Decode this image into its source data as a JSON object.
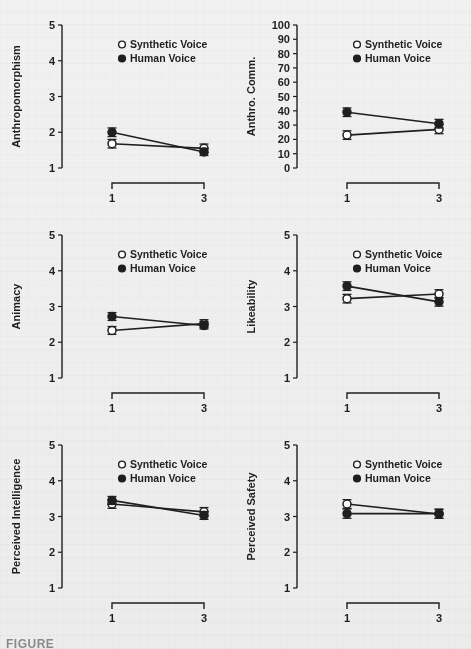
{
  "figure": {
    "caption_prefix": "FIGURE",
    "background_color": "#f1f1f1",
    "ink_color": "#1f1f1f",
    "legend": {
      "synthetic_label": "Synthetic Voice",
      "human_label": "Human Voice",
      "synthetic_marker": "open-circle",
      "human_marker": "filled-circle"
    },
    "shared_xlabel": "Number of Voices",
    "shared_xticks": [
      "1",
      "3"
    ]
  },
  "chart_data": [
    {
      "type": "line",
      "panel": "top-left",
      "title": "",
      "ylabel": "Anthropomorphism",
      "xlabel": "Number of Voices",
      "x": [
        1,
        3
      ],
      "xticklabels": [
        "1",
        "3"
      ],
      "ylim": [
        1,
        5
      ],
      "yticks": [
        1,
        2,
        3,
        4,
        5
      ],
      "yticklabels": [
        "1",
        "2",
        "3",
        "4",
        "5"
      ],
      "grid": false,
      "legend_position": "top-right-inside",
      "series": [
        {
          "name": "Synthetic Voice",
          "marker": "open-circle",
          "values": [
            1.68,
            1.55
          ],
          "errors": [
            0.12,
            0.12
          ]
        },
        {
          "name": "Human Voice",
          "marker": "filled-circle",
          "values": [
            2.0,
            1.45
          ],
          "errors": [
            0.12,
            0.1
          ]
        }
      ]
    },
    {
      "type": "line",
      "panel": "top-right",
      "title": "",
      "ylabel": "Anthro. Comm.",
      "xlabel": "Number of Voices",
      "x": [
        1,
        3
      ],
      "xticklabels": [
        "1",
        "3"
      ],
      "ylim": [
        0,
        100
      ],
      "yticks": [
        0,
        10,
        20,
        30,
        40,
        50,
        60,
        70,
        80,
        90,
        100
      ],
      "yticklabels": [
        "0",
        "10",
        "20",
        "30",
        "40",
        "50",
        "60",
        "70",
        "80",
        "90",
        "100"
      ],
      "grid": false,
      "legend_position": "top-right-inside",
      "series": [
        {
          "name": "Synthetic Voice",
          "marker": "open-circle",
          "values": [
            23,
            27
          ],
          "errors": [
            3,
            3
          ]
        },
        {
          "name": "Human Voice",
          "marker": "filled-circle",
          "values": [
            39,
            31
          ],
          "errors": [
            3,
            3
          ]
        }
      ]
    },
    {
      "type": "line",
      "panel": "middle-left",
      "title": "",
      "ylabel": "Animacy",
      "xlabel": "Number of Voices",
      "x": [
        1,
        3
      ],
      "xticklabels": [
        "1",
        "3"
      ],
      "ylim": [
        1,
        5
      ],
      "yticks": [
        1,
        2,
        3,
        4,
        5
      ],
      "yticklabels": [
        "1",
        "2",
        "3",
        "4",
        "5"
      ],
      "grid": false,
      "legend_position": "top-right-inside",
      "series": [
        {
          "name": "Synthetic Voice",
          "marker": "open-circle",
          "values": [
            2.33,
            2.52
          ],
          "errors": [
            0.11,
            0.11
          ]
        },
        {
          "name": "Human Voice",
          "marker": "filled-circle",
          "values": [
            2.72,
            2.47
          ],
          "errors": [
            0.11,
            0.1
          ]
        }
      ]
    },
    {
      "type": "line",
      "panel": "middle-right",
      "title": "",
      "ylabel": "Likeability",
      "xlabel": "Number of Voices",
      "x": [
        1,
        3
      ],
      "xticklabels": [
        "1",
        "3"
      ],
      "ylim": [
        1,
        5
      ],
      "yticks": [
        1,
        2,
        3,
        4,
        5
      ],
      "yticklabels": [
        "1",
        "2",
        "3",
        "4",
        "5"
      ],
      "grid": false,
      "legend_position": "top-right-inside",
      "series": [
        {
          "name": "Synthetic Voice",
          "marker": "open-circle",
          "values": [
            3.22,
            3.35
          ],
          "errors": [
            0.12,
            0.12
          ]
        },
        {
          "name": "Human Voice",
          "marker": "filled-circle",
          "values": [
            3.57,
            3.13
          ],
          "errors": [
            0.12,
            0.12
          ]
        }
      ]
    },
    {
      "type": "line",
      "panel": "bottom-left",
      "title": "",
      "ylabel": "Perceived Intelligence",
      "xlabel": "Number of Voices",
      "x": [
        1,
        3
      ],
      "xticklabels": [
        "1",
        "3"
      ],
      "ylim": [
        1,
        5
      ],
      "yticks": [
        1,
        2,
        3,
        4,
        5
      ],
      "yticklabels": [
        "1",
        "2",
        "3",
        "4",
        "5"
      ],
      "grid": false,
      "legend_position": "top-right-inside",
      "series": [
        {
          "name": "Synthetic Voice",
          "marker": "open-circle",
          "values": [
            3.35,
            3.13
          ],
          "errors": [
            0.12,
            0.12
          ]
        },
        {
          "name": "Human Voice",
          "marker": "filled-circle",
          "values": [
            3.45,
            3.03
          ],
          "errors": [
            0.11,
            0.11
          ]
        }
      ]
    },
    {
      "type": "line",
      "panel": "bottom-right",
      "title": "",
      "ylabel": "Perceived Safety",
      "xlabel": "Number of Voices",
      "x": [
        1,
        3
      ],
      "xticklabels": [
        "1",
        "3"
      ],
      "ylim": [
        1,
        5
      ],
      "yticks": [
        1,
        2,
        3,
        4,
        5
      ],
      "yticklabels": [
        "1",
        "2",
        "3",
        "4",
        "5"
      ],
      "grid": false,
      "legend_position": "top-right-inside",
      "series": [
        {
          "name": "Synthetic Voice",
          "marker": "open-circle",
          "values": [
            3.35,
            3.07
          ],
          "errors": [
            0.12,
            0.12
          ]
        },
        {
          "name": "Human Voice",
          "marker": "filled-circle",
          "values": [
            3.08,
            3.08
          ],
          "errors": [
            0.13,
            0.13
          ]
        }
      ]
    }
  ]
}
